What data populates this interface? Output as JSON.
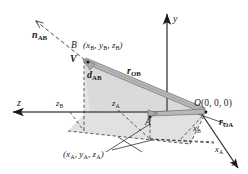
{
  "figure": {
    "type": "3d-coordinate-vector-diagram",
    "background_color": "#ffffff",
    "line_color": "#1a1a1a",
    "vector_fill_color": "#b3b3b3",
    "shade_fill_color": "#d8d8d8"
  },
  "axes": [
    {
      "name": "y-axis",
      "label": "y",
      "direction": "up"
    },
    {
      "name": "x-axis",
      "label": "x",
      "direction": "down-right"
    },
    {
      "name": "z-axis",
      "label": "z",
      "direction": "left"
    }
  ],
  "points": [
    {
      "name": "origin",
      "label": "O(0, 0, 0)",
      "letter": "O",
      "coords": "(0, 0, 0)"
    },
    {
      "name": "point-a",
      "label": "A"
    },
    {
      "name": "point-b",
      "label": "B"
    }
  ],
  "labels": {
    "point_b_coords": "(x",
    "b_coord_full": "B (xB, yB, zB)",
    "a_coord_full": "(xA, yA, zA)",
    "b_letter": "B",
    "a_letter": "A",
    "x_axis": "x",
    "y_axis": "y",
    "z_axis": "z",
    "x_a_tick": "x",
    "x_b_tick": "x",
    "z_a_tick": "z",
    "z_b_tick": "z",
    "sub_a": "A",
    "sub_b": "B",
    "origin_letter": "O",
    "origin_coords": "(0, 0, 0)",
    "paren_open": "(",
    "paren_close": ")",
    "comma": ",",
    "n_vector": "n",
    "n_sub": "AB",
    "v_vector": "V",
    "d_vector": "d",
    "d_sub": "AB",
    "r_ob_vector": "r",
    "r_ob_sub": "OB",
    "r_oa_vector": "r",
    "r_oa_sub": "OA",
    "var_x": "x",
    "var_y": "y",
    "var_z": "z"
  },
  "vectors": [
    {
      "name": "r-OB",
      "label": "rOB",
      "style": "thick-gray-arrow",
      "from": "origin",
      "to": "point-b"
    },
    {
      "name": "r-OA",
      "label": "rOA",
      "style": "thick-gray-arrow",
      "from": "origin",
      "to": "point-a"
    },
    {
      "name": "n-AB",
      "label": "nAB",
      "style": "dashed-arrow",
      "description": "unit vector from A through B extended"
    },
    {
      "name": "d-AB",
      "label": "dAB",
      "style": "dashed-vertical",
      "description": "distance from B down to projection"
    },
    {
      "name": "V",
      "label": "V",
      "style": "bold-italic-label"
    }
  ]
}
